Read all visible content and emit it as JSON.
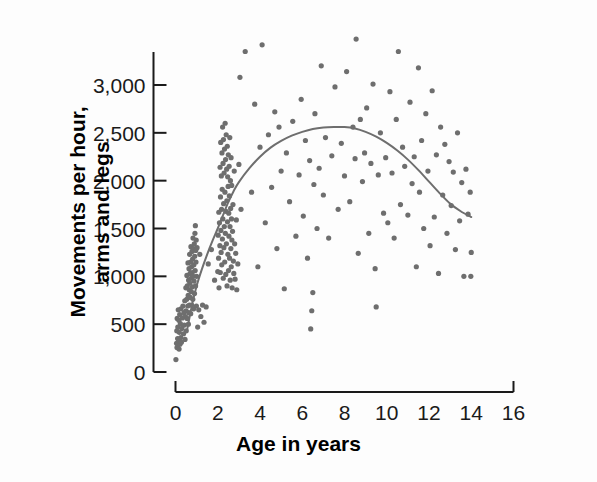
{
  "chart_data": {
    "type": "scatter",
    "title": "",
    "xlabel": "Age in years",
    "ylabel": "Movements per hour, arms and legs",
    "ylabel_line1": "Movements per hour,",
    "ylabel_line2": "arms and legs",
    "xlim": [
      0,
      16
    ],
    "ylim": [
      0,
      3250
    ],
    "xticks": [
      0,
      2,
      4,
      6,
      8,
      10,
      12,
      14,
      16
    ],
    "xtick_labels": [
      "0",
      "2",
      "4",
      "6",
      "8",
      "10",
      "12",
      "14",
      "16"
    ],
    "yticks": [
      0,
      500,
      1000,
      1500,
      2000,
      2500,
      3000
    ],
    "ytick_labels": [
      "0",
      "500",
      "1,000",
      "1,500",
      "2,000",
      "2,500",
      "3,000"
    ],
    "grid": false,
    "legend": false,
    "point_color": "#6e6e6e",
    "point_radius": 2.6,
    "curve_color": "#6e6e6e",
    "curve_width": 2.0,
    "axis_color": "#1a1a1a",
    "background_color": "#fdfdfd",
    "series": [
      {
        "name": "Movements per hour",
        "points": [
          [
            0.02,
            130
          ],
          [
            0.05,
            300
          ],
          [
            0.06,
            430
          ],
          [
            0.07,
            255
          ],
          [
            0.08,
            560
          ],
          [
            0.1,
            350
          ],
          [
            0.11,
            470
          ],
          [
            0.12,
            285
          ],
          [
            0.13,
            650
          ],
          [
            0.15,
            320
          ],
          [
            0.16,
            540
          ],
          [
            0.17,
            240
          ],
          [
            0.18,
            415
          ],
          [
            0.2,
            600
          ],
          [
            0.21,
            290
          ],
          [
            0.23,
            505
          ],
          [
            0.25,
            360
          ],
          [
            0.26,
            660
          ],
          [
            0.28,
            310
          ],
          [
            0.3,
            455
          ],
          [
            0.33,
            565
          ],
          [
            0.35,
            690
          ],
          [
            0.38,
            400
          ],
          [
            0.4,
            620
          ],
          [
            0.42,
            490
          ],
          [
            0.44,
            745
          ],
          [
            0.45,
            340
          ],
          [
            0.47,
            580
          ],
          [
            0.49,
            880
          ],
          [
            0.5,
            640
          ],
          [
            0.51,
            430
          ],
          [
            0.53,
            760
          ],
          [
            0.54,
            1010
          ],
          [
            0.55,
            560
          ],
          [
            0.56,
            900
          ],
          [
            0.58,
            690
          ],
          [
            0.59,
            1140
          ],
          [
            0.6,
            800
          ],
          [
            0.61,
            500
          ],
          [
            0.62,
            960
          ],
          [
            0.63,
            620
          ],
          [
            0.64,
            1080
          ],
          [
            0.65,
            860
          ],
          [
            0.66,
            700
          ],
          [
            0.67,
            1230
          ],
          [
            0.68,
            930
          ],
          [
            0.69,
            1030
          ],
          [
            0.7,
            780
          ],
          [
            0.71,
            1150
          ],
          [
            0.72,
            610
          ],
          [
            0.73,
            1310
          ],
          [
            0.74,
            980
          ],
          [
            0.75,
            840
          ],
          [
            0.76,
            1100
          ],
          [
            0.77,
            700
          ],
          [
            0.78,
            1260
          ],
          [
            0.79,
            1040
          ],
          [
            0.8,
            890
          ],
          [
            0.81,
            1180
          ],
          [
            0.82,
            760
          ],
          [
            0.83,
            1400
          ],
          [
            0.84,
            1000
          ],
          [
            0.85,
            1290
          ],
          [
            0.86,
            660
          ],
          [
            0.87,
            1120
          ],
          [
            0.88,
            950
          ],
          [
            0.89,
            1340
          ],
          [
            0.9,
            820
          ],
          [
            0.91,
            1210
          ],
          [
            0.92,
            1450
          ],
          [
            0.93,
            1060
          ],
          [
            0.94,
            1530
          ],
          [
            0.95,
            900
          ],
          [
            0.96,
            1270
          ],
          [
            0.97,
            1150
          ],
          [
            0.98,
            1380
          ],
          [
            0.99,
            690
          ],
          [
            1.0,
            1000
          ],
          [
            1.02,
            1300
          ],
          [
            1.05,
            470
          ],
          [
            1.1,
            650
          ],
          [
            1.15,
            1230
          ],
          [
            1.2,
            580
          ],
          [
            1.28,
            700
          ],
          [
            1.35,
            520
          ],
          [
            1.45,
            680
          ],
          [
            1.55,
            1130
          ],
          [
            1.7,
            1280
          ],
          [
            1.85,
            960
          ],
          [
            2.0,
            1050
          ],
          [
            2.02,
            1430
          ],
          [
            2.04,
            1190
          ],
          [
            2.05,
            1670
          ],
          [
            2.06,
            880
          ],
          [
            2.08,
            1560
          ],
          [
            2.1,
            1320
          ],
          [
            2.11,
            2140
          ],
          [
            2.12,
            1040
          ],
          [
            2.13,
            1830
          ],
          [
            2.14,
            2400
          ],
          [
            2.15,
            1480
          ],
          [
            2.16,
            1250
          ],
          [
            2.17,
            2050
          ],
          [
            2.18,
            1700
          ],
          [
            2.19,
            1120
          ],
          [
            2.2,
            2290
          ],
          [
            2.21,
            1910
          ],
          [
            2.22,
            1390
          ],
          [
            2.23,
            2560
          ],
          [
            2.24,
            1600
          ],
          [
            2.25,
            2180
          ],
          [
            2.26,
            980
          ],
          [
            2.27,
            2430
          ],
          [
            2.28,
            1760
          ],
          [
            2.29,
            1300
          ],
          [
            2.3,
            2080
          ],
          [
            2.31,
            1520
          ],
          [
            2.32,
            2330
          ],
          [
            2.33,
            1150
          ],
          [
            2.34,
            1880
          ],
          [
            2.35,
            2600
          ],
          [
            2.36,
            1450
          ],
          [
            2.37,
            2220
          ],
          [
            2.38,
            1020
          ],
          [
            2.39,
            1680
          ],
          [
            2.4,
            2480
          ],
          [
            2.41,
            1340
          ],
          [
            2.42,
            2120
          ],
          [
            2.43,
            1790
          ],
          [
            2.44,
            900
          ],
          [
            2.45,
            2360
          ],
          [
            2.46,
            1570
          ],
          [
            2.47,
            2040
          ],
          [
            2.48,
            1230
          ],
          [
            2.49,
            1940
          ],
          [
            2.5,
            2270
          ],
          [
            2.51,
            1060
          ],
          [
            2.52,
            1660
          ],
          [
            2.53,
            1420
          ],
          [
            2.54,
            2150
          ],
          [
            2.55,
            1840
          ],
          [
            2.56,
            1190
          ],
          [
            2.57,
            2450
          ],
          [
            2.58,
            1520
          ],
          [
            2.59,
            960
          ],
          [
            2.6,
            2000
          ],
          [
            2.61,
            1710
          ],
          [
            2.62,
            1290
          ],
          [
            2.63,
            2240
          ],
          [
            2.64,
            1100
          ],
          [
            2.65,
            1600
          ],
          [
            2.66,
            1950
          ],
          [
            2.67,
            1380
          ],
          [
            2.68,
            880
          ],
          [
            2.7,
            1470
          ],
          [
            2.72,
            1750
          ],
          [
            2.74,
            1160
          ],
          [
            2.76,
            1030
          ],
          [
            2.78,
            2100
          ],
          [
            2.8,
            1340
          ],
          [
            2.82,
            970
          ],
          [
            2.85,
            1240
          ],
          [
            2.88,
            1590
          ],
          [
            2.9,
            860
          ],
          [
            2.95,
            1130
          ],
          [
            3.0,
            2170
          ],
          [
            3.05,
            3080
          ],
          [
            3.1,
            1700
          ],
          [
            3.3,
            3350
          ],
          [
            3.6,
            1880
          ],
          [
            3.75,
            2800
          ],
          [
            3.9,
            1100
          ],
          [
            4.0,
            2350
          ],
          [
            4.1,
            3420
          ],
          [
            4.25,
            1560
          ],
          [
            4.4,
            2480
          ],
          [
            4.55,
            1930
          ],
          [
            4.7,
            2720
          ],
          [
            4.8,
            1290
          ],
          [
            4.9,
            2560
          ],
          [
            5.0,
            2100
          ],
          [
            5.15,
            870
          ],
          [
            5.25,
            2290
          ],
          [
            5.4,
            1780
          ],
          [
            5.55,
            2620
          ],
          [
            5.7,
            1420
          ],
          [
            5.85,
            2060
          ],
          [
            5.95,
            2850
          ],
          [
            6.05,
            1630
          ],
          [
            6.15,
            2420
          ],
          [
            6.25,
            1190
          ],
          [
            6.35,
            2210
          ],
          [
            6.4,
            450
          ],
          [
            6.45,
            640
          ],
          [
            6.5,
            830
          ],
          [
            6.55,
            1960
          ],
          [
            6.6,
            2700
          ],
          [
            6.7,
            1500
          ],
          [
            6.8,
            2130
          ],
          [
            6.9,
            3200
          ],
          [
            7.0,
            1850
          ],
          [
            7.1,
            2450
          ],
          [
            7.25,
            1400
          ],
          [
            7.4,
            2260
          ],
          [
            7.55,
            2980
          ],
          [
            7.7,
            1700
          ],
          [
            7.85,
            2390
          ],
          [
            8.0,
            2050
          ],
          [
            8.1,
            3140
          ],
          [
            8.25,
            1780
          ],
          [
            8.4,
            2560
          ],
          [
            8.5,
            2230
          ],
          [
            8.55,
            3480
          ],
          [
            8.65,
            1240
          ],
          [
            8.75,
            2640
          ],
          [
            8.85,
            1990
          ],
          [
            8.95,
            2290
          ],
          [
            9.05,
            2760
          ],
          [
            9.15,
            1450
          ],
          [
            9.25,
            2180
          ],
          [
            9.35,
            3010
          ],
          [
            9.45,
            1080
          ],
          [
            9.5,
            680
          ],
          [
            9.6,
            2060
          ],
          [
            9.7,
            2500
          ],
          [
            9.85,
            1660
          ],
          [
            9.95,
            2240
          ],
          [
            10.05,
            1560
          ],
          [
            10.15,
            2930
          ],
          [
            10.25,
            2080
          ],
          [
            10.35,
            1400
          ],
          [
            10.45,
            2640
          ],
          [
            10.55,
            3350
          ],
          [
            10.65,
            1750
          ],
          [
            10.75,
            2350
          ],
          [
            10.85,
            2150
          ],
          [
            11.0,
            1640
          ],
          [
            11.1,
            2820
          ],
          [
            11.2,
            1970
          ],
          [
            11.3,
            2250
          ],
          [
            11.4,
            1100
          ],
          [
            11.5,
            3180
          ],
          [
            11.55,
            1880
          ],
          [
            11.65,
            2420
          ],
          [
            11.75,
            1500
          ],
          [
            11.85,
            2700
          ],
          [
            11.95,
            2100
          ],
          [
            12.05,
            1320
          ],
          [
            12.15,
            2940
          ],
          [
            12.25,
            1620
          ],
          [
            12.35,
            2270
          ],
          [
            12.45,
            1030
          ],
          [
            12.55,
            2560
          ],
          [
            12.65,
            1850
          ],
          [
            12.75,
            2380
          ],
          [
            12.85,
            1450
          ],
          [
            12.95,
            2200
          ],
          [
            13.05,
            1740
          ],
          [
            13.15,
            2090
          ],
          [
            13.25,
            1280
          ],
          [
            13.35,
            2500
          ],
          [
            13.45,
            1580
          ],
          [
            13.55,
            1980
          ],
          [
            13.65,
            1000
          ],
          [
            13.75,
            2120
          ],
          [
            13.85,
            1650
          ],
          [
            13.95,
            1880
          ],
          [
            13.98,
            1000
          ],
          [
            14.0,
            1250
          ]
        ]
      }
    ],
    "trend_curve": {
      "type": "fitted-quadratic-smooth",
      "description": "Rises steeply from age 0.5, peaks near age 8 at about 2,560 movements per hour, then declines to about 1,620 at age 14.",
      "peak_x": 8.0,
      "peak_y": 2560,
      "start_x": 0.55,
      "start_y": 440,
      "end_x": 14.0,
      "end_y": 1620,
      "points": [
        [
          0.55,
          440
        ],
        [
          0.8,
          720
        ],
        [
          1.0,
          900
        ],
        [
          1.25,
          1075
        ],
        [
          1.5,
          1230
        ],
        [
          1.75,
          1370
        ],
        [
          2.0,
          1500
        ],
        [
          2.25,
          1640
        ],
        [
          2.5,
          1775
        ],
        [
          2.75,
          1890
        ],
        [
          3.0,
          1985
        ],
        [
          3.5,
          2130
        ],
        [
          4.0,
          2250
        ],
        [
          4.5,
          2345
        ],
        [
          5.0,
          2415
        ],
        [
          5.5,
          2470
        ],
        [
          6.0,
          2510
        ],
        [
          6.5,
          2540
        ],
        [
          7.0,
          2555
        ],
        [
          7.5,
          2560
        ],
        [
          8.0,
          2560
        ],
        [
          8.5,
          2545
        ],
        [
          9.0,
          2510
        ],
        [
          9.5,
          2460
        ],
        [
          10.0,
          2395
        ],
        [
          10.5,
          2315
        ],
        [
          11.0,
          2220
        ],
        [
          11.5,
          2110
        ],
        [
          12.0,
          1990
        ],
        [
          12.5,
          1870
        ],
        [
          13.0,
          1760
        ],
        [
          13.5,
          1680
        ],
        [
          14.0,
          1620
        ]
      ]
    }
  },
  "axes": {
    "x_title": "Age in years",
    "y_title_line1": "Movements per hour,",
    "y_title_line2": "arms and legs"
  }
}
